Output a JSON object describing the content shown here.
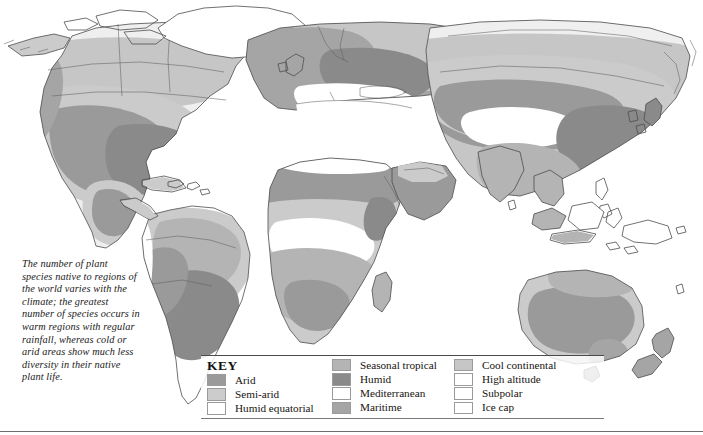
{
  "page": {
    "width": 703,
    "height": 435
  },
  "caption": {
    "text": "The number of plant species native to regions of the world varies with the climate; the greatest number of species occurs in warm regions with regular rainfall, whereas cold or arid areas show much less diversity in their native plant life."
  },
  "legend": {
    "title": "KEY",
    "columns": [
      {
        "items": [
          {
            "label": "Arid",
            "color": "#9a9a9a"
          },
          {
            "label": "Semi-arid",
            "color": "#cccccc"
          },
          {
            "label": "Humid equatorial",
            "color": "#ffffff"
          }
        ]
      },
      {
        "items": [
          {
            "label": "Seasonal tropical",
            "color": "#b4b4b4"
          },
          {
            "label": "Humid",
            "color": "#8a8a8a"
          },
          {
            "label": "Mediterranean",
            "color": "#ffffff"
          },
          {
            "label": "Maritime",
            "color": "#a5a5a5"
          }
        ]
      },
      {
        "items": [
          {
            "label": "Cool continental",
            "color": "#c6c6c6"
          },
          {
            "label": "High altitude",
            "color": "#ffffff"
          },
          {
            "label": "Subpolar",
            "color": "#ffffff"
          },
          {
            "label": "Ice cap",
            "color": "#ffffff"
          }
        ]
      }
    ]
  },
  "map": {
    "outline_color": "#4a4a4a",
    "ocean_color": "#ffffff",
    "regions": [
      {
        "name": "north-america",
        "climates": [
          "Subpolar",
          "Cool continental",
          "Semi-arid",
          "Arid",
          "Humid",
          "Maritime"
        ]
      },
      {
        "name": "greenland",
        "climates": [
          "Ice cap"
        ]
      },
      {
        "name": "south-america",
        "climates": [
          "Humid equatorial",
          "Seasonal tropical",
          "Semi-arid",
          "Arid",
          "Humid",
          "High altitude"
        ]
      },
      {
        "name": "europe",
        "climates": [
          "Maritime",
          "Cool continental",
          "Mediterranean",
          "Subpolar"
        ]
      },
      {
        "name": "africa",
        "climates": [
          "Humid equatorial",
          "Seasonal tropical",
          "Semi-arid",
          "Arid",
          "Mediterranean"
        ]
      },
      {
        "name": "asia",
        "climates": [
          "Subpolar",
          "Cool continental",
          "Arid",
          "Semi-arid",
          "High altitude",
          "Humid",
          "Seasonal tropical"
        ]
      },
      {
        "name": "australia",
        "climates": [
          "Arid",
          "Semi-arid",
          "Seasonal tropical",
          "Maritime"
        ]
      },
      {
        "name": "new-zealand",
        "climates": [
          "Maritime"
        ]
      }
    ]
  }
}
